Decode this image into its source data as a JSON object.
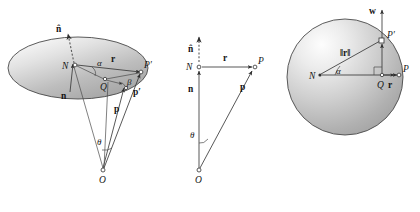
{
  "figure": {
    "background_color": "#ffffff",
    "line_color": "#3a3a3a",
    "surface_fill_light": "#f2f2f2",
    "surface_fill_dark": "#a6a6a6",
    "panels": [
      {
        "id": "left",
        "name": "oblique-ellipse-panel",
        "shape": "ellipse",
        "labels": [
          {
            "key": "n_hat",
            "text": "n̂",
            "style": "bold",
            "role": "unit-normal-vector"
          },
          {
            "key": "N",
            "text": "N",
            "style": "italic",
            "role": "surface-point"
          },
          {
            "key": "n_bold",
            "text": "n",
            "style": "bold",
            "role": "normal-vector"
          },
          {
            "key": "alpha",
            "text": "α",
            "style": "greek",
            "role": "angle-alpha"
          },
          {
            "key": "beta",
            "text": "β",
            "style": "greek",
            "role": "angle-beta"
          },
          {
            "key": "theta",
            "text": "θ",
            "style": "greek",
            "role": "angle-theta"
          },
          {
            "key": "r",
            "text": "r",
            "style": "bold",
            "role": "radius-vector"
          },
          {
            "key": "P_prime",
            "text": "P′",
            "style": "italic",
            "role": "projected-point"
          },
          {
            "key": "p_prime",
            "text": "p′",
            "style": "bold",
            "role": "projected-position-vector"
          },
          {
            "key": "p_bold",
            "text": "p",
            "style": "bold",
            "role": "position-vector"
          },
          {
            "key": "Q",
            "text": "Q",
            "style": "italic",
            "role": "foot-point"
          },
          {
            "key": "O",
            "text": "O",
            "style": "italic",
            "role": "origin"
          }
        ]
      },
      {
        "id": "middle",
        "name": "planar-triangle-panel",
        "shape": "triangle",
        "labels": [
          {
            "key": "n_hat",
            "text": "n̂",
            "style": "bold",
            "role": "unit-normal-vector"
          },
          {
            "key": "N",
            "text": "N",
            "style": "italic",
            "role": "surface-point"
          },
          {
            "key": "r",
            "text": "r",
            "style": "bold",
            "role": "radius-vector"
          },
          {
            "key": "P",
            "text": "P",
            "style": "italic",
            "role": "point-p"
          },
          {
            "key": "n_bold",
            "text": "n",
            "style": "bold",
            "role": "normal-vector"
          },
          {
            "key": "p_bold",
            "text": "p",
            "style": "bold",
            "role": "position-vector"
          },
          {
            "key": "theta",
            "text": "θ",
            "style": "greek",
            "role": "angle-theta"
          },
          {
            "key": "O",
            "text": "O",
            "style": "italic",
            "role": "origin"
          }
        ]
      },
      {
        "id": "right",
        "name": "sphere-panel",
        "shape": "circle",
        "labels": [
          {
            "key": "w",
            "text": "w",
            "style": "bold",
            "role": "w-vector"
          },
          {
            "key": "P_prime",
            "text": "P′",
            "style": "italic",
            "role": "point-on-sphere"
          },
          {
            "key": "r_norm",
            "text": "‖r‖",
            "style": "bold",
            "role": "radius-magnitude"
          },
          {
            "key": "N",
            "text": "N",
            "style": "italic",
            "role": "sphere-center-left-point"
          },
          {
            "key": "alpha",
            "text": "α",
            "style": "greek",
            "role": "angle-alpha"
          },
          {
            "key": "Q",
            "text": "Q",
            "style": "italic",
            "role": "foot-point"
          },
          {
            "key": "r",
            "text": "r",
            "style": "bold",
            "role": "radius-vector"
          },
          {
            "key": "P",
            "text": "P",
            "style": "italic",
            "role": "point-p"
          }
        ]
      }
    ]
  }
}
